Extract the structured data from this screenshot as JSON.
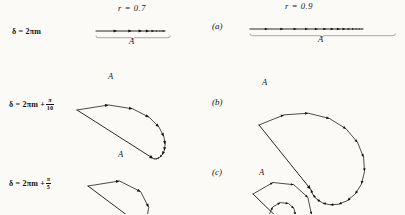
{
  "figure": {
    "background_color": "#fbfaf7",
    "ink_color": "#15110d",
    "columns": [
      {
        "id": "left",
        "r_label": "r = 0.7",
        "r_symbol": "r",
        "r_value": 0.7
      },
      {
        "id": "right",
        "r_label": "r = 0.9",
        "r_symbol": "r",
        "r_value": 0.9
      }
    ],
    "rows": [
      {
        "panel": "(a)",
        "delta_text": "δ = 2πm",
        "delta_base": "δ = 2πm",
        "delta_extra_num": "",
        "delta_extra_den": "",
        "phase_step_deg": 0,
        "resultant_label": "A"
      },
      {
        "panel": "(b)",
        "delta_text": "δ = 2πm + π/10",
        "delta_base": "δ = 2πm +",
        "delta_extra_num": "π",
        "delta_extra_den": "10",
        "phase_step_deg": 18,
        "resultant_label": "A"
      },
      {
        "panel": "(c)",
        "delta_text": "δ = 2πm + π/5",
        "delta_base": "δ = 2πm +",
        "delta_extra_num": "π",
        "delta_extra_den": "5",
        "phase_step_deg": 36,
        "resultant_label": "A"
      }
    ]
  },
  "chart_data": {
    "type": "line",
    "xlabel": "",
    "ylabel": "",
    "grid": false,
    "legend": false,
    "series": [
      {
        "name": "delta = 2(pi)m, r = 0.7",
        "panel": "(a)",
        "column": "left",
        "r": 0.7,
        "phase_step_deg": 0,
        "n_vectors": 12,
        "resultant_label": "A",
        "shape": "collinear"
      },
      {
        "name": "delta = 2(pi)m, r = 0.9",
        "panel": "(a)",
        "column": "right",
        "r": 0.9,
        "phase_step_deg": 0,
        "n_vectors": 14,
        "resultant_label": "A",
        "shape": "collinear"
      },
      {
        "name": "delta = 2(pi)m + (pi)/10, r = 0.7",
        "panel": "(b)",
        "column": "left",
        "r": 0.7,
        "phase_step_deg": 18,
        "n_vectors": 12,
        "resultant_label": "A",
        "shape": "spiral"
      },
      {
        "name": "delta = 2(pi)m + (pi)/10, r = 0.9",
        "panel": "(b)",
        "column": "right",
        "r": 0.9,
        "phase_step_deg": 18,
        "n_vectors": 16,
        "resultant_label": "A",
        "shape": "spiral"
      },
      {
        "name": "delta = 2(pi)m + (pi)/5, r = 0.7",
        "panel": "(c)",
        "column": "left",
        "r": 0.7,
        "phase_step_deg": 36,
        "n_vectors": 12,
        "resultant_label": "A",
        "shape": "spiral"
      },
      {
        "name": "delta = 2(pi)m + (pi)/5, r = 0.9",
        "panel": "(c)",
        "column": "right",
        "r": 0.9,
        "phase_step_deg": 36,
        "n_vectors": 18,
        "resultant_label": "A",
        "shape": "spiral"
      }
    ]
  }
}
